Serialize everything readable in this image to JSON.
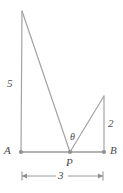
{
  "figure": {
    "type": "geometry-diagram",
    "colors": {
      "line": "#9a9a9a",
      "point": "#8f8f8f",
      "text": "#4a4a4a",
      "background": "#ffffff"
    },
    "points": [
      {
        "name": "A",
        "label": "A",
        "x": 21,
        "y": 152
      },
      {
        "name": "P",
        "label": "P",
        "x": 70,
        "y": 152
      },
      {
        "name": "B",
        "label": "B",
        "x": 104,
        "y": 152
      },
      {
        "name": "apex",
        "label": "",
        "x": 22,
        "y": 11
      },
      {
        "name": "peak",
        "label": "",
        "x": 104,
        "y": 96
      }
    ],
    "segments": [
      {
        "name": "baseline-AB",
        "from": "A",
        "to": "B"
      },
      {
        "name": "left-vertical-A-apex",
        "from": "A",
        "to": "apex"
      },
      {
        "name": "apex-to-P",
        "from": "apex",
        "to": "P"
      },
      {
        "name": "P-to-peak",
        "from": "P",
        "to": "peak"
      },
      {
        "name": "right-vertical-peak-B",
        "from": "peak",
        "to": "B"
      }
    ],
    "labels": {
      "point_a": "A",
      "point_b": "B",
      "point_p": "P",
      "left_side_length": "5",
      "right_side_length": "2",
      "base_length": "3",
      "angle": "θ"
    },
    "dimension": {
      "name": "base-dimension-3",
      "value": "3",
      "from_x": 21,
      "to_x": 104,
      "y": 176
    }
  }
}
